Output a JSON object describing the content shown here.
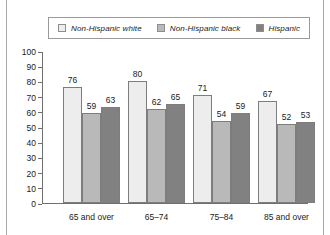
{
  "legend": {
    "items": [
      {
        "label": "Non-Hispanic white",
        "color": "#ededed",
        "swatch_name": "legend-swatch-non-hispanic-white"
      },
      {
        "label": "Non-Hispanic black",
        "color": "#b9b9b9",
        "swatch_name": "legend-swatch-non-hispanic-black"
      },
      {
        "label": "Hispanic",
        "color": "#818181",
        "swatch_name": "legend-swatch-hispanic"
      }
    ]
  },
  "chart_data": {
    "type": "bar",
    "title": "",
    "xlabel": "",
    "ylabel": "",
    "ylim": [
      0,
      100
    ],
    "yticks": [
      0,
      10,
      20,
      30,
      40,
      50,
      60,
      70,
      80,
      90,
      100
    ],
    "grid": false,
    "legend_position": "top",
    "categories": [
      "65 and over",
      "65–74",
      "75–84",
      "85 and over"
    ],
    "series": [
      {
        "name": "Non-Hispanic white",
        "color": "#ededed",
        "values": [
          76,
          80,
          71,
          67
        ]
      },
      {
        "name": "Non-Hispanic black",
        "color": "#b9b9b9",
        "values": [
          59,
          62,
          54,
          52
        ]
      },
      {
        "name": "Hispanic",
        "color": "#818181",
        "values": [
          63,
          65,
          59,
          53
        ]
      }
    ]
  },
  "axis": {
    "ticks": [
      "100",
      "90",
      "80",
      "70",
      "60",
      "50",
      "40",
      "30",
      "20",
      "10",
      "0"
    ]
  }
}
